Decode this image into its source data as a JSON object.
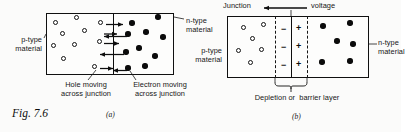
{
  "figure": {
    "number_label": "Fig. 7.6",
    "panels": [
      {
        "key": "a",
        "label": "(a)"
      },
      {
        "key": "b",
        "label": "(b)"
      }
    ]
  },
  "panel_a": {
    "left_label": "p-type\nmaterial",
    "right_label": "n-type\nmaterial",
    "caption_left": "Hole moving\nacross junction",
    "caption_right": "Electron moving\nacross junction",
    "carriers": {
      "holes_label": "hole",
      "electrons_label": "electron",
      "hole_positions": [
        {
          "x": 55,
          "y": 22
        },
        {
          "x": 76,
          "y": 17
        },
        {
          "x": 62,
          "y": 33
        },
        {
          "x": 84,
          "y": 30
        },
        {
          "x": 53,
          "y": 45
        },
        {
          "x": 74,
          "y": 44
        },
        {
          "x": 63,
          "y": 58
        },
        {
          "x": 100,
          "y": 22
        },
        {
          "x": 99,
          "y": 41
        },
        {
          "x": 94,
          "y": 66
        }
      ],
      "electron_positions": [
        {
          "x": 132,
          "y": 23
        },
        {
          "x": 158,
          "y": 17
        },
        {
          "x": 146,
          "y": 32
        },
        {
          "x": 128,
          "y": 34
        },
        {
          "x": 163,
          "y": 37
        },
        {
          "x": 139,
          "y": 48
        },
        {
          "x": 126,
          "y": 52
        },
        {
          "x": 155,
          "y": 56
        },
        {
          "x": 145,
          "y": 66
        },
        {
          "x": 128,
          "y": 68
        }
      ],
      "hole_arrows": [
        {
          "x1": 106,
          "y": 22,
          "x2": 124
        },
        {
          "x1": 104,
          "y": 41,
          "x2": 120
        },
        {
          "x1": 100,
          "y": 66,
          "x2": 114
        }
      ],
      "electron_arrows": [
        {
          "x1": 125,
          "y": 34,
          "x2": 102
        },
        {
          "x1": 120,
          "y": 52,
          "x2": 98
        },
        {
          "x1": 124,
          "y": 68,
          "x2": 112
        }
      ]
    }
  },
  "panel_b": {
    "top_left_label": "Junction",
    "top_right_label": "voltage",
    "left_label": "p-type\nmaterial",
    "right_label": "n-type\nmaterial",
    "caption": "Depletion or  barrier layer",
    "negative_sign": "−",
    "positive_sign": "+",
    "negative_count": 3,
    "positive_count": 3,
    "hole_positions": [
      {
        "x": 243,
        "y": 27
      },
      {
        "x": 263,
        "y": 24
      },
      {
        "x": 252,
        "y": 38
      },
      {
        "x": 238,
        "y": 50
      },
      {
        "x": 261,
        "y": 49
      },
      {
        "x": 250,
        "y": 62
      }
    ],
    "electron_positions": [
      {
        "x": 323,
        "y": 26
      },
      {
        "x": 350,
        "y": 23
      },
      {
        "x": 337,
        "y": 41
      },
      {
        "x": 353,
        "y": 44
      },
      {
        "x": 322,
        "y": 62
      },
      {
        "x": 350,
        "y": 61
      }
    ]
  },
  "colors": {
    "ink": "#101010",
    "paper": "#fbfbfa",
    "electron_fill": "#0b0b0b",
    "hole_fill": "#ffffff"
  }
}
